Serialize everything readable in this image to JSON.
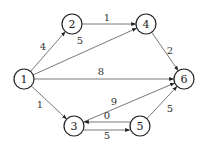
{
  "graph": {
    "directed": true,
    "nodes": [
      "1",
      "2",
      "3",
      "4",
      "5",
      "6"
    ],
    "edges": [
      {
        "from": "1",
        "to": "2",
        "weight": "4"
      },
      {
        "from": "1",
        "to": "4",
        "weight": "5"
      },
      {
        "from": "1",
        "to": "6",
        "weight": "8"
      },
      {
        "from": "1",
        "to": "3",
        "weight": "1"
      },
      {
        "from": "2",
        "to": "4",
        "weight": "1"
      },
      {
        "from": "4",
        "to": "6",
        "weight": "2"
      },
      {
        "from": "3",
        "to": "6",
        "weight": "9"
      },
      {
        "from": "5",
        "to": "3",
        "weight": "0"
      },
      {
        "from": "3",
        "to": "5",
        "weight": "5"
      },
      {
        "from": "5",
        "to": "6",
        "weight": "5"
      }
    ],
    "colors": {
      "stroke": "#222222",
      "edge": "#555555"
    }
  }
}
